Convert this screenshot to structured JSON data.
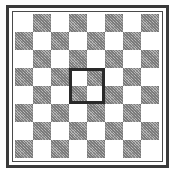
{
  "board": {
    "rows": 8,
    "cols": 8,
    "first_cell_light": true,
    "colors": {
      "light": "#ffffff",
      "dark": "#9a9a9a",
      "frame": "#3a3a3a",
      "highlight": "#2a2a2a"
    }
  },
  "highlight": {
    "row": 3,
    "col": 3,
    "row_span": 2,
    "col_span": 2
  }
}
